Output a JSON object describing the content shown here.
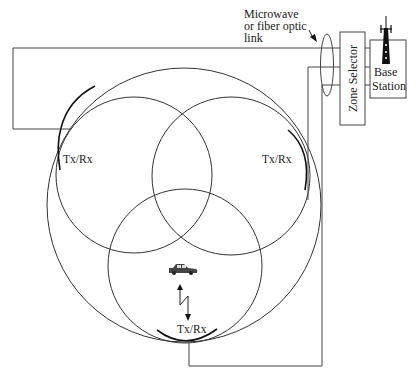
{
  "diagram": {
    "type": "cellular zone system",
    "labels": {
      "link_line1": "Microwave",
      "link_line2": "or fiber optic",
      "link_line3": "link",
      "zone_selector": "Zone Selector",
      "base_station_line1": "Base",
      "base_station_line2": "Station",
      "txrx_left": "Tx/Rx",
      "txrx_right": "Tx/Rx",
      "txrx_bottom": "Tx/Rx"
    },
    "icons": {
      "tower": "radio-tower-icon",
      "car": "car-icon",
      "radio_link": "lightning-bidirectional-arrow-icon"
    },
    "colors": {
      "line": "#333333",
      "background": "#ffffff"
    }
  }
}
